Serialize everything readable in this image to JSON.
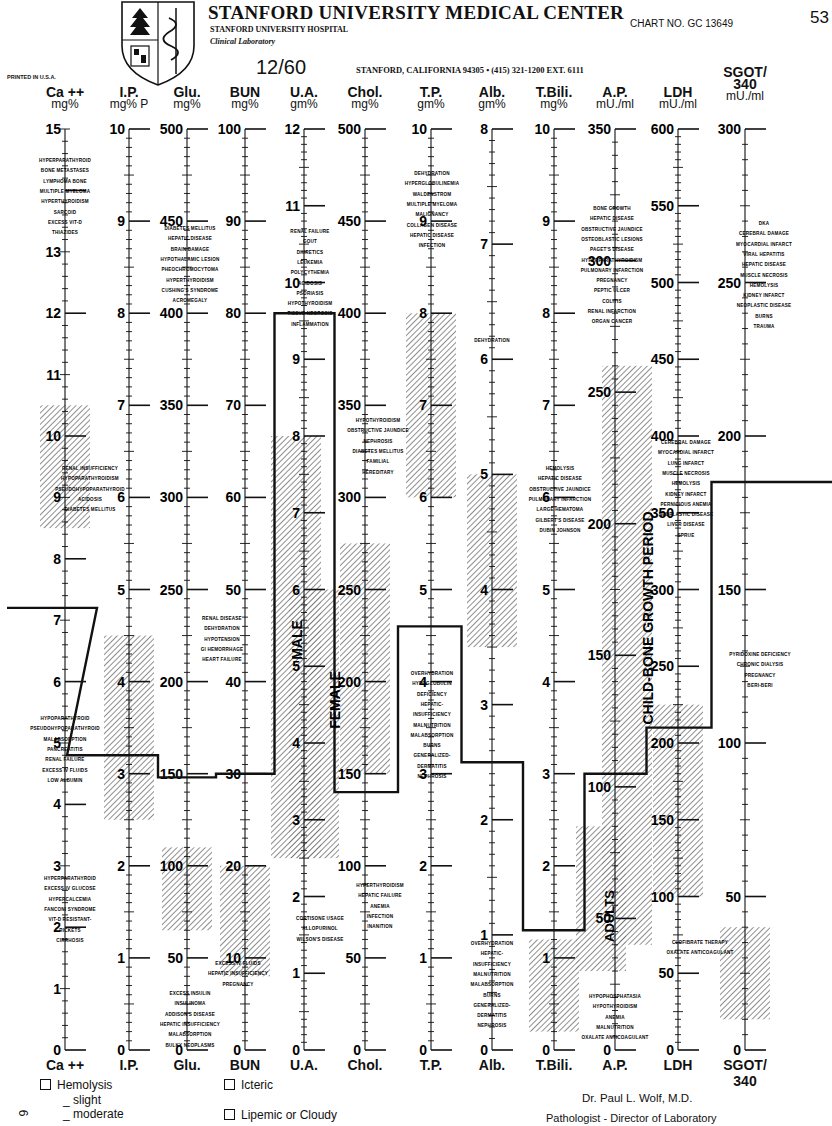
{
  "header": {
    "institution": "STANFORD UNIVERSITY MEDICAL CENTER",
    "hospital": "STANFORD UNIVERSITY HOSPITAL",
    "department": "Clinical Laboratory",
    "chart_no": "CHART NO. GC 13649",
    "page_marker": "53",
    "date": "12/60",
    "address": "STANFORD, CALIFORNIA 94305 • (415) 321-1200 EXT. 6111",
    "printed": "PRINTED IN U.S.A."
  },
  "columns": [
    {
      "id": "ca",
      "name": "Ca ++",
      "unit": "mg%",
      "foot": "Ca ++",
      "max": 15,
      "labels": [
        15,
        13,
        12,
        11,
        10,
        9,
        8,
        7,
        6,
        5,
        4,
        3,
        2,
        1,
        0
      ]
    },
    {
      "id": "ip",
      "name": "I.P.",
      "unit": "mg% P",
      "foot": "I.P.",
      "max": 10,
      "labels": [
        10,
        9,
        8,
        7,
        6,
        5,
        4,
        3,
        2,
        1,
        0
      ]
    },
    {
      "id": "glu",
      "name": "Glu.",
      "unit": "mg%",
      "foot": "Glu.",
      "max": 500,
      "labels": [
        500,
        450,
        400,
        350,
        300,
        250,
        200,
        150,
        100,
        50,
        0
      ]
    },
    {
      "id": "bun",
      "name": "BUN",
      "unit": "mg%",
      "foot": "BUN",
      "max": 100,
      "labels": [
        100,
        90,
        80,
        70,
        60,
        50,
        40,
        30,
        20,
        10,
        0
      ]
    },
    {
      "id": "ua",
      "name": "U.A.",
      "unit": "gm%",
      "foot": "U.A.",
      "max": 12,
      "labels": [
        12,
        11,
        10,
        9,
        8,
        7,
        6,
        5,
        4,
        3,
        2,
        1,
        0
      ]
    },
    {
      "id": "chol",
      "name": "Chol.",
      "unit": "mg%",
      "foot": "Chol.",
      "max": 500,
      "labels": [
        500,
        450,
        400,
        350,
        300,
        250,
        200,
        150,
        100,
        50,
        0
      ]
    },
    {
      "id": "tp",
      "name": "T.P.",
      "unit": "gm%",
      "foot": "T.P.",
      "max": 10,
      "labels": [
        10,
        9,
        8,
        7,
        6,
        5,
        4,
        3,
        2,
        1,
        0
      ]
    },
    {
      "id": "alb",
      "name": "Alb.",
      "unit": "gm%",
      "foot": "Alb.",
      "max": 8,
      "labels": [
        8,
        7,
        6,
        5,
        4,
        3,
        2,
        1,
        0
      ]
    },
    {
      "id": "tbili",
      "name": "T.Bili.",
      "unit": "mg%",
      "foot": "T.Bili.",
      "max": 10,
      "labels": [
        10,
        9,
        8,
        7,
        6,
        5,
        4,
        3,
        2,
        1,
        0
      ]
    },
    {
      "id": "ap",
      "name": "A.P.",
      "unit": "mU./ml",
      "foot": "A.P.",
      "max": 350,
      "labels": [
        350,
        300,
        250,
        200,
        150,
        100,
        50,
        0
      ]
    },
    {
      "id": "ldh",
      "name": "LDH",
      "unit": "mU./ml",
      "foot": "LDH",
      "max": 600,
      "labels": [
        600,
        550,
        500,
        450,
        400,
        350,
        300,
        250,
        200,
        150,
        100,
        50,
        0
      ]
    },
    {
      "id": "sgot",
      "name": "SGOT/ 340",
      "unit": "mU./ml",
      "foot": "SGOT/ 340",
      "max": 300,
      "labels": [
        300,
        250,
        200,
        150,
        100,
        50,
        0
      ]
    }
  ],
  "normal_ranges": {
    "ca": [
      8.5,
      10.5
    ],
    "ip": [
      2.5,
      4.5
    ],
    "glu": [
      65,
      110
    ],
    "bun": [
      8,
      20
    ],
    "ua_male": [
      2.5,
      8.0
    ],
    "ua_female": [
      2.5,
      6.0
    ],
    "chol": [
      150,
      275
    ],
    "tp": [
      6.0,
      8.0
    ],
    "alb": [
      3.5,
      5.0
    ],
    "tbili": [
      0.2,
      1.2
    ],
    "ap_adults": [
      30,
      85
    ],
    "ap_child": [
      40,
      260
    ],
    "ldh": [
      100,
      225
    ],
    "sgot": [
      10,
      40
    ]
  },
  "range_labels": {
    "male": "MALE",
    "female": "FEMALE",
    "child": "CHILD-BONE GROWTH PERIOD",
    "adults": "ADULTS"
  },
  "chart_data": {
    "type": "line",
    "categories": [
      "Ca++",
      "I.P.",
      "Glu.",
      "BUN",
      "U.A.",
      "Chol.",
      "T.P.",
      "Alb.",
      "T.Bili.",
      "A.P.",
      "LDH",
      "SGOT"
    ],
    "series": [
      {
        "name": "Patient result (12/60)",
        "values": [
          7.2,
          3.2,
          148,
          30,
          9.6,
          140,
          4.6,
          2.5,
          1.3,
          105,
          210,
          185
        ]
      }
    ],
    "units": [
      "mg%",
      "mg% P",
      "mg%",
      "mg%",
      "gm%",
      "mg%",
      "gm%",
      "gm%",
      "mg%",
      "mU./ml",
      "mU./ml",
      "mU./ml"
    ],
    "grid": false
  },
  "annotations": {
    "ca_high": [
      "HYPERPARATHYROID",
      "BONE METASTASES",
      "LYMPHOMA BONE",
      "MULTIPLE MYELOMA",
      "HYPERTHYROIDISM",
      "SARCOID",
      "EXCESS VIT-D",
      "THIAZIDES"
    ],
    "ca_low": [
      "HYPOPARATHYROID",
      "PSEUDOHYPOPARATHYROID",
      "MALABSORPTION",
      "PANCREATITIS",
      "RENAL FAILURE",
      "EXCESS IV FLUIDS",
      "LOW ALBUMIN"
    ],
    "ip_high": [
      "RENAL INSUFFICIENCY",
      "HYPOPARATHYROIDISM",
      "PSEUDOHYPOPARATHYROID",
      "ACIDOSIS",
      "DIABETES MELLITUS"
    ],
    "ip_low": [
      "HYPERPARATHYROID",
      "EXCESS IV GLUCOSE",
      "HYPERCALCEMIA",
      "FANCONI SYNDROME",
      "VIT-D RESISTANT-",
      "RICKETS",
      "CIRRHOSIS"
    ],
    "glu_high": [
      "DIABETES MELLITUS",
      "HEPATIC DISEASE",
      "BRAIN DAMAGE",
      "HYPOTHALAMIC LESION",
      "PHEOCHROMOCYTOMA",
      "HYPERTHYROIDISM",
      "CUSHING'S SYNDROME",
      "ACROMEGALY"
    ],
    "glu_low": [
      "EXCESS INSULIN",
      "INSULINOMA",
      "ADDISON'S DISEASE",
      "HEPATIC INSUFFICIENCY",
      "MALABSORPTION",
      "BULKY NEOPLASMS"
    ],
    "bun_high": [
      "RENAL DISEASE",
      "DEHYDRATION",
      "HYPOTENSION",
      "GI HEMORRHAGE",
      "HEART FAILURE"
    ],
    "bun_low": [
      "EXCESS IV FLUIDS",
      "HEPATIC INSUFFICIENCY",
      "PREGNANCY"
    ],
    "ua_high": [
      "RENAL FAILURE",
      "GOUT",
      "DIURETICS",
      "LEUKEMIA",
      "POLYCYTHEMIA",
      "ACIDOSIS",
      "PSORIASIS",
      "HYPOTHYROIDISM",
      "TISSUE NECROSIS",
      "INFLAMMATION"
    ],
    "ua_low": [
      "CORTISONE USAGE",
      "ALLOPURINOL",
      "WILSON'S DISEASE"
    ],
    "chol_high": [
      "HYPOTHYROIDISM",
      "OBSTRUCTIVE JAUNDICE",
      "NEPHROSIS",
      "DIABETES MELLITUS",
      "FAMILIAL",
      "HEREDITARY"
    ],
    "chol_low": [
      "HYPERTHYROIDISM",
      "HEPATIC FAILURE",
      "ANEMIA",
      "INFECTION",
      "INANITION"
    ],
    "tp_high": [
      "DEHYDRATION",
      "HYPERGLOBULINEMIA",
      "WALDENSTROM",
      "MULTIPLE MYELOMA",
      "MALIGNANCY",
      "COLLAGEN DISEASE",
      "HEPATIC DISEASE",
      "INFECTION"
    ],
    "tp_low": [
      "OVERHYDRATION",
      "HYPOGLOBULIN",
      "DEFICIENCY",
      "HEPATIC-",
      "INSUFFICIENCY",
      "MALNUTRITION",
      "MALABSORPTION",
      "BURNS",
      "GENERALIZED-",
      "DERMATITIS",
      "NEPHROSIS"
    ],
    "alb_high": [
      "DEHYDRATION"
    ],
    "alb_low": [
      "OVERHYDRATION",
      "HEPATIC-",
      "INSUFFICIENCY",
      "MALNUTRITION",
      "MALABSORPTION",
      "BURNS",
      "GENERALIZED-",
      "DERMATITIS",
      "NEPHROSIS"
    ],
    "tbili_high": [
      "HEMOLYSIS",
      "HEPATIC DISEASE",
      "OBSTRUCTIVE JAUNDICE",
      "PULMONARY INFARCTION",
      "LARGE HEMATOMA",
      "GILBERT'S DISEASE",
      "DUBIN JOHNSON"
    ],
    "ap_high": [
      "BONE GROWTH",
      "HEPATIC DISEASE",
      "OBSTRUCTIVE JAUNDICE",
      "OSTEOBLASTIC LESIONS",
      "PAGET'S DISEASE",
      "HYPERPARATHYROIDISM",
      "PULMONARY INFARCTION",
      "PREGNANCY",
      "PEPTIC ULCER",
      "COLITIS",
      "RENAL INFARCTION",
      "ORGAN CANCER"
    ],
    "ap_low": [
      "HYPOPHOSPHATASIA",
      "HYPOTHYROIDISM",
      "ANEMIA",
      "MALNUTRITION",
      "OXALATE ANTICOAGULANT"
    ],
    "ldh_high": [
      "CEREBRAL DAMAGE",
      "MYOCARDIAL INFARCT",
      "LUNG INFARCT",
      "MUSCLE NECROSIS",
      "HEMOLYSIS",
      "KIDNEY INFARCT",
      "PERNICIOUS ANEMIA",
      "NEOPLASTIC DISEASE",
      "LIVER DISEASE",
      "SPRUE"
    ],
    "ldh_low": [
      "CLOFIBRATE THERAPY",
      "OXALATE ANTICOAGULANT"
    ],
    "sgot_high": [
      "DKA",
      "CEREBRAL DAMAGE",
      "MYOCARDIAL INFARCT",
      "VIRAL HEPATITIS",
      "HEPATIC DISEASE",
      "MUSCLE NECROSIS",
      "HEMOLYSIS",
      "KIDNEY INFARCT",
      "NEOPLASTIC DISEASE",
      "BURNS",
      "TRAUMA"
    ],
    "sgot_low": [
      "PYRIDOXINE DEFICIENCY",
      "CHRONIC DIALYSIS",
      "PREGNANCY",
      "BERI-BERI"
    ]
  },
  "footer": {
    "hemolysis": "Hemolysis",
    "slight": "slight",
    "moderate": "moderate",
    "icteric": "Icteric",
    "lipemic": "Lipemic or Cloudy",
    "doctor": "Dr. Paul L. Wolf, M.D.",
    "doctor_title": "Pathologist - Director of Laboratory",
    "side_mark": "6"
  }
}
